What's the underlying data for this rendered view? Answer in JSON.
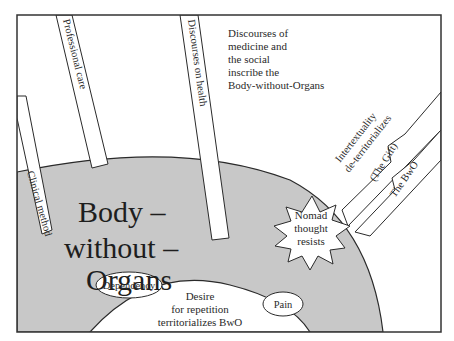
{
  "diagram": {
    "central_concept": {
      "lines": [
        "Body –",
        "without –",
        "Organs"
      ]
    },
    "annotation": {
      "lines": [
        "Discourses of",
        "medicine and",
        "the social",
        "inscribe the",
        "Body-without-Organs"
      ]
    },
    "strips": [
      {
        "label": "Clinical method"
      },
      {
        "label": "Professional care"
      },
      {
        "label": "Discourses on health"
      }
    ],
    "bolts": [
      {
        "label_lines": [
          "Intertextuality",
          "de-territorializes"
        ]
      },
      {
        "label": "(The Gift)"
      },
      {
        "label": "The BwO"
      }
    ],
    "starburst": {
      "lines": [
        "Nomad",
        "thought",
        "resists"
      ]
    },
    "inner_region": {
      "lines": [
        "Desire",
        "for repetition",
        "territorializes BwO"
      ]
    },
    "ovals": [
      {
        "label": "Dependency"
      },
      {
        "label": "Pain"
      }
    ],
    "colors": {
      "frame": "#333333",
      "gray_region": "#c8c8c8",
      "white": "#ffffff",
      "stroke": "#2a2a2a"
    }
  }
}
